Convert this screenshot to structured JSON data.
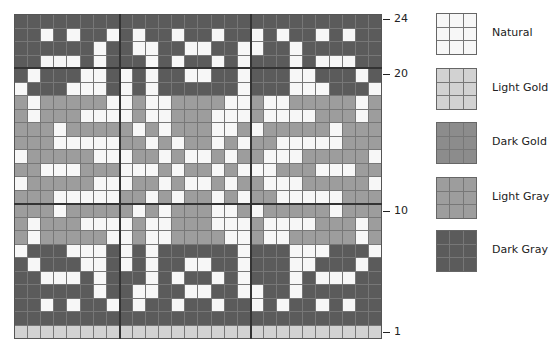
{
  "chart_data": {
    "type": "heatmap",
    "title": "",
    "columns": 28,
    "rows_count": 24,
    "row_tick_labels": [
      {
        "row": 24,
        "label": "24"
      },
      {
        "row": 20,
        "label": "20"
      },
      {
        "row": 10,
        "label": "10"
      },
      {
        "row": 1,
        "label": "1"
      }
    ],
    "thick_vertical_lines_after_col": [
      8,
      18
    ],
    "thick_horizontal_lines_above_row": [
      20,
      10
    ],
    "legend": [
      {
        "code": "N",
        "label": "Natural",
        "color": "#f7f7f7"
      },
      {
        "code": "G",
        "label": "Light Gold",
        "color": "#d2d2d2"
      },
      {
        "code": "Y",
        "label": "Dark Gold",
        "color": "#8c8c8c"
      },
      {
        "code": "L",
        "label": "Light Gray",
        "color": "#9d9d9d"
      },
      {
        "code": "D",
        "label": "Dark Gray",
        "color": "#5b5b5b"
      }
    ],
    "grid_top_to_bottom": [
      {
        "row": 24,
        "cells": "DDDDDDDDDDDDDDDDDDDDDDDDDDDD"
      },
      {
        "row": 23,
        "cells": "DDNDNDDNDNDDNDDNDDNDNDDNDNDD"
      },
      {
        "row": 22,
        "cells": "DDDDDDNDDNNDDNNDDNNDDNDDDDDD"
      },
      {
        "row": 21,
        "cells": "DDNNNDNDDDNDNDDNDNDDDNDNNNDD"
      },
      {
        "row": 20,
        "cells": "DNDDDNNDNDNDDNNDDNDDDNNDDDND"
      },
      {
        "row": 19,
        "cells": "NDDDNNNDNDNDDDDDDNDDDNNNDDDN"
      },
      {
        "row": 18,
        "cells": "LNLLLLLNNLNNLLLLNNLNNLLLLLNL"
      },
      {
        "row": 17,
        "cells": "LNLLLNNNNLNNLLLNNNLNNNNLLLNL"
      },
      {
        "row": 16,
        "cells": "LLLNLLLLLNLNLLLNNLNLLLLLNLLL"
      },
      {
        "row": 15,
        "cells": "LLLNNNNNLLNLNLLNLNLLNNNNNLLL"
      },
      {
        "row": 14,
        "cells": "NLLLLLNNNLLNLNNLNLLNNNLLLLLN"
      },
      {
        "row": 13,
        "cells": "LLNNNLLLNNNLNLLNLNNNLLLNNNLL"
      },
      {
        "row": 12,
        "cells": "NLLLLLNNNLLNLNNLNLLNNNLLLLLN"
      },
      {
        "row": 11,
        "cells": "LLLNNNNNLLNLNLLNLNLLNNNNNLLL"
      },
      {
        "row": 10,
        "cells": "LLLNLLLLLNLNLLLNNLNLLLLLNLLL"
      },
      {
        "row": 9,
        "cells": "LNLLLNNNNLNNLLLNNNLNNNNLLLNL"
      },
      {
        "row": 8,
        "cells": "LNLLLLLNNLNNLLLLNNLNNLLLLLNL"
      },
      {
        "row": 7,
        "cells": "NDDDNNNDNDNDDDDDDNDDDNNNDDDN"
      },
      {
        "row": 6,
        "cells": "DNDDDNNDNDNDDNNDDNDDDNNDDDND"
      },
      {
        "row": 5,
        "cells": "DDNNNDNDDDNDNDDNDNDDDNDNNNDD"
      },
      {
        "row": 4,
        "cells": "DDDDDDNDDNNDDNNDDNNDDNDDDDDD"
      },
      {
        "row": 3,
        "cells": "DDNDNDDNDNDDNDDNDDNDNDDNDNDD"
      },
      {
        "row": 2,
        "cells": "DDDDDDDDDDDDDDDDDDDDDDDDDDDD"
      },
      {
        "row": 1,
        "cells": "GGGGGGGGGGGGGGGGGGGGGGGGGGGG"
      }
    ],
    "xlabel": "",
    "ylabel": ""
  },
  "labels": {
    "row24": "24",
    "row20": "20",
    "row10": "10",
    "row1": "1"
  },
  "legend": {
    "natural": "Natural",
    "light_gold": "Light Gold",
    "dark_gold": "Dark Gold",
    "light_gray": "Light Gray",
    "dark_gray": "Dark Gray"
  }
}
